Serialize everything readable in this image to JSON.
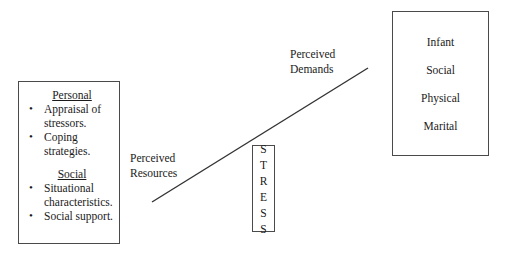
{
  "diagram": {
    "line_color": "#333333",
    "border_color": "#4a4a4a"
  },
  "resources_box": {
    "groups": [
      {
        "heading": "Personal",
        "items": [
          "Appraisal of stressors.",
          "Coping strategies."
        ]
      },
      {
        "heading": "Social",
        "items": [
          "Situational characteristics.",
          "Social support."
        ]
      }
    ]
  },
  "stress_box": {
    "label": "STRESS",
    "letters": [
      "S",
      "T",
      "R",
      "E",
      "S",
      "S"
    ]
  },
  "outcomes_box": {
    "items": [
      "Infant",
      "Social",
      "Physical",
      "Marital"
    ]
  },
  "labels": {
    "demands": "Perceived\nDemands",
    "resources": "Perceived\nResources"
  }
}
